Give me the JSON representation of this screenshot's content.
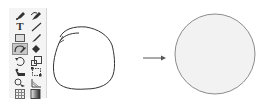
{
  "toolbar": {
    "tools": [
      {
        "name": "pen-tool",
        "col": 0,
        "row": 0
      },
      {
        "name": "curvature-tool",
        "col": 1,
        "row": 0
      },
      {
        "name": "type-tool",
        "col": 0,
        "row": 1,
        "glyph": "T"
      },
      {
        "name": "line-segment-tool",
        "col": 1,
        "row": 1
      },
      {
        "name": "rectangle-tool",
        "col": 0,
        "row": 2
      },
      {
        "name": "paintbrush-tool",
        "col": 1,
        "row": 2
      },
      {
        "name": "shaper-tool",
        "col": 0,
        "row": 3,
        "selected": true
      },
      {
        "name": "eraser-tool",
        "col": 1,
        "row": 3
      },
      {
        "name": "rotate-tool",
        "col": 0,
        "row": 4
      },
      {
        "name": "scale-tool",
        "col": 1,
        "row": 4
      },
      {
        "name": "puppet-warp-tool",
        "col": 0,
        "row": 5
      },
      {
        "name": "free-transform-tool",
        "col": 1,
        "row": 5
      },
      {
        "name": "shape-builder-tool",
        "col": 0,
        "row": 6
      },
      {
        "name": "perspective-grid-tool",
        "col": 1,
        "row": 6
      },
      {
        "name": "mesh-tool",
        "col": 0,
        "row": 7
      },
      {
        "name": "gradient-tool",
        "col": 1,
        "row": 7
      }
    ],
    "type_glyph": "T"
  },
  "diagram": {
    "before_label": "hand-drawn-shape",
    "after_label": "perfect-circle",
    "circle_fill": "#f2f2f2",
    "circle_stroke": "#8c8c8c",
    "sketch_stroke": "#333333",
    "arrow_color": "#555555"
  }
}
